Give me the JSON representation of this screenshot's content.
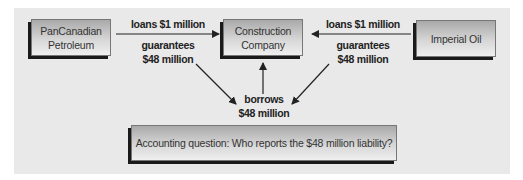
{
  "diagram": {
    "entities": {
      "pancanadian": {
        "line1": "PanCanadian",
        "line2": "Petroleum"
      },
      "construction": {
        "line1": "Construction",
        "line2": "Company"
      },
      "imperial": {
        "line1": "Imperial Oil"
      }
    },
    "labels": {
      "left_loan": "loans $1 million",
      "left_guarantee_1": "guarantees",
      "left_guarantee_2": "$48 million",
      "right_loan": "loans $1 million",
      "right_guarantee_1": "guarantees",
      "right_guarantee_2": "$48 million",
      "borrows_1": "borrows",
      "borrows_2": "$48 million"
    },
    "question": "Accounting question: Who reports the $48 million liability?"
  }
}
